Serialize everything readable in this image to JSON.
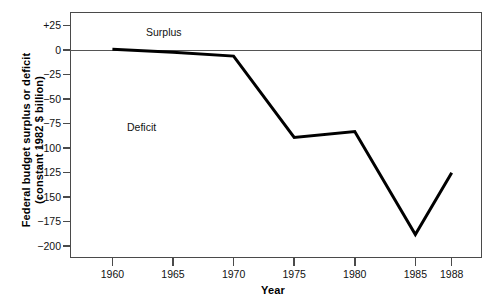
{
  "chart_data": {
    "type": "line",
    "title": "",
    "xlabel": "Year",
    "ylabel": "Federal budget surplus or deficit (constant 1982 $ billion)",
    "ylabel_line1": "Federal budget surplus or deficit",
    "ylabel_line2": "(constant 1982 $ billion)",
    "x": [
      1960,
      1965,
      1970,
      1975,
      1980,
      1985,
      1988
    ],
    "values": [
      1,
      -2,
      -6,
      -89,
      -83,
      -188,
      -125
    ],
    "xticks": [
      "1960",
      "1965",
      "1970",
      "1975",
      "1980",
      "1985",
      "1988"
    ],
    "xtick_values": [
      1960,
      1965,
      1970,
      1975,
      1980,
      1985,
      1988
    ],
    "yticks": [
      "+25",
      "0",
      "−25",
      "−50",
      "−75",
      "−100",
      "−125",
      "−150",
      "−175",
      "−200"
    ],
    "ytick_values": [
      25,
      0,
      -25,
      -50,
      -75,
      -100,
      -125,
      -150,
      -175,
      -200
    ],
    "xlim": [
      1956.5,
      1990.5
    ],
    "ylim": [
      -212,
      39
    ],
    "grid": false,
    "legend": "none",
    "annotations": [
      {
        "text": "Surplus",
        "x": 1962,
        "y": 19
      },
      {
        "text": "Deficit",
        "x": 1961,
        "y": -67
      }
    ],
    "reference_line": {
      "y": 0,
      "color": "#555555"
    },
    "series_color": "#000000",
    "series_width": 3
  },
  "annotations": {
    "surplus": "Surplus",
    "deficit": "Deficit"
  }
}
